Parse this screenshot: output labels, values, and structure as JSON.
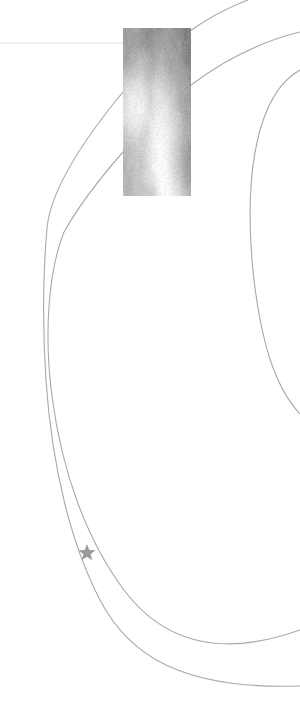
{
  "figure": {
    "kind": "sky-chart-cutout",
    "width": 300,
    "height": 711,
    "background_color": "#ffffff",
    "title": "",
    "caption": ""
  },
  "image_cutout": {
    "name": "survey-image-cutout",
    "description": "grayscale astronomical survey image patch",
    "x": 123,
    "y": 28,
    "width": 68,
    "height": 168,
    "dark_value": "#8a8a8a",
    "mid_value": "#b4b4b4",
    "light_value": "#fafafa",
    "noise_amount": 18
  },
  "grid_lines": [
    {
      "name": "horizontal-grid-line",
      "x1": 0,
      "y1": 43,
      "x2": 123,
      "y2": 43,
      "color": "#e2e2e2",
      "width": 1
    }
  ],
  "arcs": [
    {
      "name": "arc-outer-upper",
      "d": "M 248 0 C 210 14 160 46 118 98 C 76 150 50 196 47 228",
      "color": "#a8a8ae",
      "width": 1.1
    },
    {
      "name": "arc-outer-lower",
      "d": "M 47 228 C 44 262 42 320 46 380 C 52 470 72 546 100 600 C 128 654 180 690 300 686",
      "color": "#a8a8ae",
      "width": 1.1
    },
    {
      "name": "arc-inner-upper",
      "d": "M 300 32 C 250 44 196 74 154 118 C 112 162 82 200 64 232",
      "color": "#a8a8ae",
      "width": 1.1
    },
    {
      "name": "arc-inner-lower",
      "d": "M 64 232 C 48 272 44 336 52 396 C 62 474 88 542 124 590 C 160 638 216 660 300 630",
      "color": "#a8a8ae",
      "width": 1.1
    },
    {
      "name": "arc-right-outer",
      "d": "M 300 70 C 286 78 276 90 268 108 C 250 148 246 210 254 280 C 262 346 276 388 300 414",
      "color": "#a8a8ae",
      "width": 1.1
    }
  ],
  "markers": [
    {
      "name": "target-star-marker",
      "shape": "star5",
      "cx": 87,
      "cy": 553,
      "radius": 9,
      "color": "#9a9a9a",
      "label": ""
    }
  ],
  "legend": {
    "visible": false,
    "entries": []
  },
  "chart_data": {
    "type": "scatter",
    "title": "",
    "xlabel": "",
    "ylabel": "",
    "xlim": [
      0,
      300
    ],
    "ylim": [
      0,
      711
    ],
    "grid": false,
    "legend_position": "none",
    "points": [
      {
        "name": "target-star",
        "x": 87,
        "y": 553,
        "marker": "star",
        "color": "#9a9a9a",
        "size": 18
      }
    ],
    "series": [
      {
        "name": "arc-outer",
        "type": "line",
        "color": "#a8a8ae",
        "x": [
          248,
          205,
          160,
          118,
          78,
          50,
          47,
          45,
          46,
          56,
          78,
          100,
          132,
          185,
          240,
          300
        ],
        "y": [
          0,
          16,
          48,
          98,
          152,
          200,
          228,
          284,
          380,
          470,
          544,
          600,
          648,
          678,
          686,
          686
        ]
      },
      {
        "name": "arc-inner",
        "type": "line",
        "color": "#a8a8ae",
        "x": [
          300,
          252,
          198,
          156,
          118,
          84,
          64,
          54,
          52,
          62,
          90,
          124,
          162,
          216,
          266,
          300
        ],
        "y": [
          32,
          44,
          74,
          118,
          160,
          204,
          232,
          282,
          340,
          404,
          482,
          548,
          598,
          632,
          644,
          630
        ]
      },
      {
        "name": "arc-right",
        "type": "line",
        "color": "#a8a8ae",
        "x": [
          300,
          286,
          274,
          266,
          256,
          250,
          252,
          258,
          268,
          282,
          300
        ],
        "y": [
          70,
          78,
          92,
          110,
          150,
          202,
          262,
          312,
          360,
          392,
          414
        ]
      }
    ],
    "annotations": [
      {
        "name": "image-cutout-region",
        "type": "image",
        "x": 123,
        "y": 28,
        "width": 68,
        "height": 168
      },
      {
        "name": "horizontal-grid-line",
        "type": "line",
        "x": [
          0,
          123
        ],
        "y": [
          43,
          43
        ]
      }
    ]
  }
}
